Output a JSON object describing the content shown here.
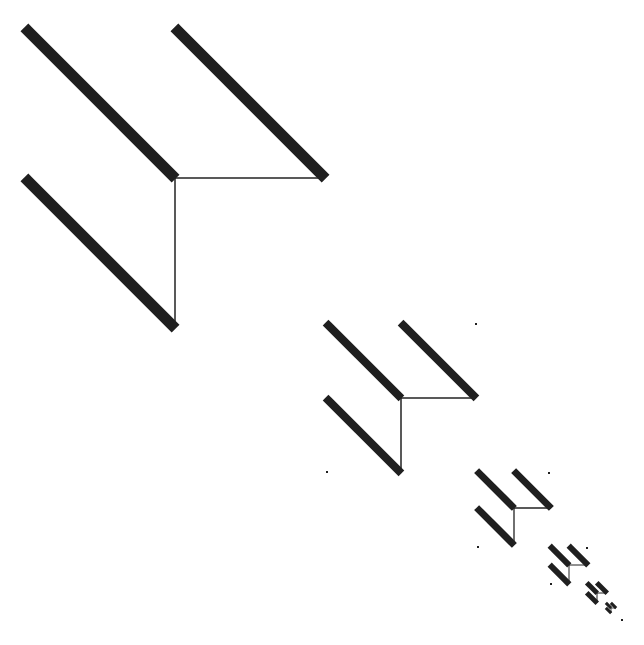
{
  "diagram": {
    "type": "recursive-sparse-matrix-pattern",
    "background": "#ffffff",
    "ink_color": "#1f1f1f",
    "line_color": "#222222",
    "levels": [
      {
        "x": 25,
        "y": 28,
        "size": 300,
        "band": 11,
        "line": 1.5
      },
      {
        "x": 326,
        "y": 323,
        "size": 150,
        "band": 8,
        "line": 1.5
      },
      {
        "x": 477,
        "y": 471,
        "size": 74,
        "band": 7,
        "line": 1.3
      },
      {
        "x": 550,
        "y": 546,
        "size": 38,
        "band": 6,
        "line": 1
      },
      {
        "x": 587,
        "y": 583,
        "size": 20,
        "band": 5,
        "line": 1
      },
      {
        "x": 606,
        "y": 603,
        "size": 10,
        "band": 3,
        "line": 0.8
      }
    ],
    "stray_dots": [
      {
        "x": 476,
        "y": 324
      },
      {
        "x": 327,
        "y": 472
      },
      {
        "x": 549,
        "y": 473
      },
      {
        "x": 478,
        "y": 547
      },
      {
        "x": 587,
        "y": 548
      },
      {
        "x": 551,
        "y": 584
      },
      {
        "x": 622,
        "y": 620
      }
    ]
  }
}
